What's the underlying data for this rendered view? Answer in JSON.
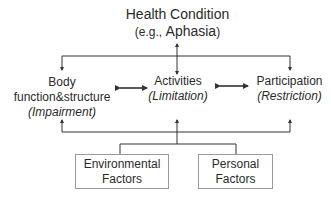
{
  "header": {
    "title": "Health Condition",
    "subtitle_prefix": "(e.g., ",
    "subtitle_example": "Aphasia",
    "subtitle_suffix": ")"
  },
  "components": [
    {
      "line1": "Body",
      "line2": "function&structure",
      "qualifier": "(Impairment)"
    },
    {
      "line1": "Activities",
      "qualifier": "(Limitation)"
    },
    {
      "line1": "Participation",
      "qualifier": "(Restriction)"
    }
  ],
  "factors": [
    {
      "line1": "Environmental",
      "line2": "Factors"
    },
    {
      "line1": "Personal",
      "line2": "Factors"
    }
  ],
  "colors": {
    "line": "#333333",
    "box_border": "#9a9a9a",
    "text": "#2a2a2a"
  }
}
